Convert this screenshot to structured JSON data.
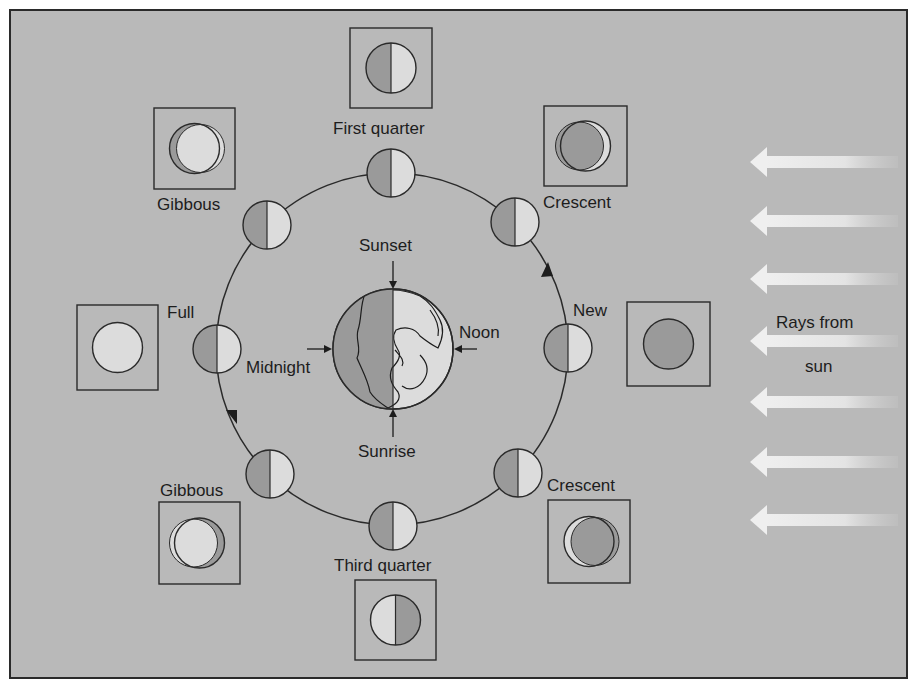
{
  "colors": {
    "background": "#b9b9b9",
    "dark_side": "#9a9a9a",
    "lit_side": "#dcdcdc",
    "outline": "#2a2a2a",
    "ray": "#e8e8e8"
  },
  "labels": {
    "first_quarter": "First quarter",
    "crescent_top": "Crescent",
    "gibbous_top": "Gibbous",
    "full": "Full",
    "new": "New",
    "gibbous_bottom": "Gibbous",
    "crescent_bottom": "Crescent",
    "third_quarter": "Third quarter",
    "sunset": "Sunset",
    "sunrise": "Sunrise",
    "noon": "Noon",
    "midnight": "Midnight",
    "rays_line1": "Rays from",
    "rays_line2": "sun"
  },
  "phases": [
    {
      "name": "New",
      "orbit_pos": [
        568,
        348
      ],
      "box": [
        627,
        302,
        83,
        84
      ],
      "appearance": "new"
    },
    {
      "name": "Crescent",
      "orbit_pos": [
        515,
        222
      ],
      "box": [
        544,
        106,
        83,
        80
      ],
      "appearance": "waxing-crescent"
    },
    {
      "name": "First quarter",
      "orbit_pos": [
        391,
        173
      ],
      "box": [
        350,
        28,
        82,
        80
      ],
      "appearance": "first-quarter"
    },
    {
      "name": "Gibbous",
      "orbit_pos": [
        267,
        225
      ],
      "box": [
        154,
        108,
        81,
        81
      ],
      "appearance": "waxing-gibbous"
    },
    {
      "name": "Full",
      "orbit_pos": [
        217,
        349
      ],
      "box": [
        77,
        305,
        81,
        85
      ],
      "appearance": "full"
    },
    {
      "name": "Gibbous",
      "orbit_pos": [
        270,
        474
      ],
      "box": [
        159,
        502,
        81,
        82
      ],
      "appearance": "waning-gibbous"
    },
    {
      "name": "Third quarter",
      "orbit_pos": [
        393,
        526
      ],
      "box": [
        355,
        580,
        81,
        80
      ],
      "appearance": "third-quarter"
    },
    {
      "name": "Crescent",
      "orbit_pos": [
        518,
        473
      ],
      "box": [
        548,
        500,
        82,
        83
      ],
      "appearance": "waning-crescent"
    }
  ],
  "rays_y": [
    162,
    221,
    279,
    341,
    402,
    462,
    520
  ]
}
